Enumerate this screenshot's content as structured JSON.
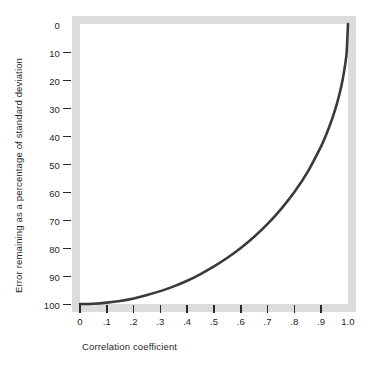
{
  "chart_data": {
    "type": "line",
    "title": "",
    "xlabel": "Correlation coefficient",
    "ylabel": "Error remaining as  a  percentage of standard deviation",
    "xlim": [
      0,
      1.0
    ],
    "ylim": [
      0,
      100
    ],
    "y_axis_inverted": true,
    "grid": false,
    "legend": null,
    "xticks": [
      0,
      0.1,
      0.2,
      0.3,
      0.4,
      0.5,
      0.6,
      0.7,
      0.8,
      0.9,
      1.0
    ],
    "xticklabels": [
      "0",
      ".1",
      ".2",
      ".3",
      ".4",
      ".5",
      ".6",
      ".7",
      ".8",
      ".9",
      "1.0"
    ],
    "yticks": [
      0,
      10,
      20,
      30,
      40,
      50,
      60,
      70,
      80,
      90,
      100
    ],
    "yticklabels": [
      "0",
      "10",
      "20",
      "30",
      "40",
      "50",
      "60",
      "70",
      "80",
      "90",
      "100"
    ],
    "series": [
      {
        "name": "Coefficient of alienation",
        "formula": "100 * sqrt(1 - r^2)",
        "color": "#3a3a3a",
        "x": [
          0,
          0.05,
          0.1,
          0.15,
          0.2,
          0.25,
          0.3,
          0.35,
          0.4,
          0.45,
          0.5,
          0.55,
          0.6,
          0.65,
          0.7,
          0.75,
          0.8,
          0.85,
          0.9,
          0.92,
          0.94,
          0.95,
          0.96,
          0.97,
          0.98,
          0.99,
          0.995,
          1.0
        ],
        "values": [
          100,
          99.9,
          99.5,
          98.9,
          98,
          96.8,
          95.4,
          93.7,
          91.7,
          89.3,
          86.6,
          83.5,
          80,
          76,
          71.4,
          66.1,
          60,
          52.7,
          43.6,
          39.2,
          34.1,
          31.2,
          28,
          24.3,
          19.9,
          14.1,
          10,
          0
        ]
      }
    ]
  },
  "axes": {
    "x_title": "Correlation coefficient",
    "y_title": "Error remaining as  a  percentage of standard deviation",
    "x_tick_labels": [
      "0",
      ".1",
      ".2",
      ".3",
      ".4",
      ".5",
      ".6",
      ".7",
      ".8",
      ".9",
      "1.0"
    ],
    "y_tick_labels": [
      "0",
      "10",
      "20",
      "30",
      "40",
      "50",
      "60",
      "70",
      "80",
      "90",
      "100"
    ]
  },
  "style": {
    "frame_color": "#dcdcdc",
    "curve_color": "#3a3a3a",
    "background": "#ffffff",
    "text_color": "#1f1f1f"
  }
}
